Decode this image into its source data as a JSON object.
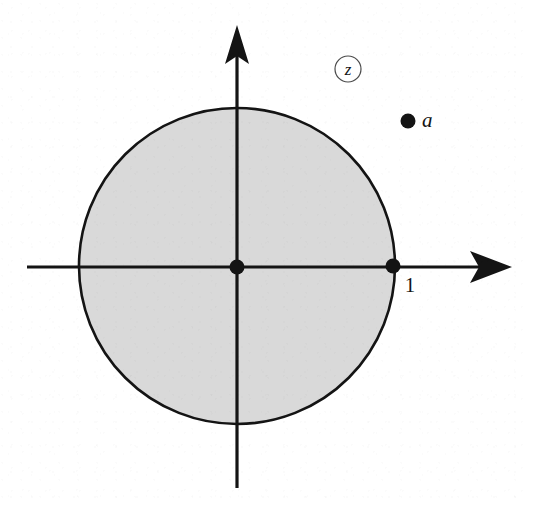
{
  "figure": {
    "kind": "complex-plane-unit-disk-diagram",
    "canvas": {
      "width": 533,
      "height": 508,
      "background": "#ffffff"
    },
    "plane_label": "z",
    "plane_label_style": "circled-italic",
    "colors": {
      "ink": "#141414",
      "disk_fill": "#d9d9d9",
      "disk_stroke": "#141414",
      "circle_badge_stroke": "#4a4a4a",
      "background": "#ffffff"
    },
    "axes": {
      "horizontal": {
        "name": "real-axis",
        "y": 267,
        "x_start": 27,
        "x_end": 512,
        "stroke_width": 3.2,
        "arrowhead": "right"
      },
      "vertical": {
        "name": "imaginary-axis",
        "x": 237,
        "y_start": 488,
        "y_end": 25,
        "stroke_width": 3.2,
        "arrowhead": "up"
      }
    },
    "disk": {
      "name": "unit-disk",
      "center_x": 237,
      "center_y": 266,
      "radius": 158,
      "fill": "#d9d9d9",
      "stroke": "#141414",
      "stroke_width": 2.6
    },
    "badge": {
      "name": "plane-label-badge",
      "center_x": 348,
      "center_y": 69,
      "radius": 13,
      "stroke_width": 1.2,
      "text": "z",
      "font_size": 17
    },
    "points": [
      {
        "id": "origin",
        "name": "origin-point",
        "label": "",
        "x": 237,
        "y": 267,
        "radius": 7.5
      },
      {
        "id": "one",
        "name": "unit-point",
        "label": "1",
        "label_x": 410,
        "label_y": 292,
        "label_style": "plain",
        "label_font_size": 21,
        "x": 393,
        "y": 266,
        "radius": 7.5
      },
      {
        "id": "a",
        "name": "point-a",
        "label": "a",
        "label_x": 422,
        "label_y": 127,
        "label_style": "italic",
        "label_font_size": 21,
        "x": 408,
        "y": 121,
        "radius": 7.5
      }
    ]
  },
  "chart_data": {
    "type": "scatter",
    "title": "",
    "subtitle": "",
    "xlabel": "",
    "ylabel": "",
    "xlim": [
      -1.33,
      1.74
    ],
    "ylim": [
      -1.4,
      1.53
    ],
    "grid": false,
    "legend": null,
    "annotations": [
      {
        "text": "z",
        "kind": "plane-label-circled",
        "x": 0.7,
        "y": 1.25
      },
      {
        "text": "1",
        "kind": "tick-label",
        "x": 1.0,
        "y": -0.16
      },
      {
        "text": "a",
        "kind": "point-label",
        "x": 1.17,
        "y": 0.92
      }
    ],
    "shapes": [
      {
        "kind": "circle",
        "name": "unit circle (shaded interior)",
        "center": [
          0,
          0
        ],
        "radius": 1.0,
        "fill": "#d9d9d9",
        "stroke": "#141414"
      }
    ],
    "series": [
      {
        "name": "marked points",
        "marker": "filled-circle",
        "color": "#141414",
        "points": [
          {
            "label": "0",
            "x": 0.0,
            "y": 0.0
          },
          {
            "label": "1",
            "x": 1.0,
            "y": 0.0
          },
          {
            "label": "a",
            "x": 1.08,
            "y": 0.92
          }
        ]
      }
    ]
  }
}
